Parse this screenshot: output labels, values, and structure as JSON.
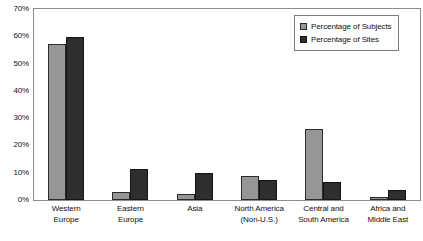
{
  "chart_data": {
    "type": "bar",
    "title": "",
    "xlabel": "",
    "ylabel": "",
    "ylim": [
      0,
      70
    ],
    "grid": false,
    "legend_position": "top-right",
    "ytick_labels": [
      "70%",
      "60%",
      "50%",
      "40%",
      "30%",
      "20%",
      "10%",
      "0%"
    ],
    "ytick_values": [
      70,
      60,
      50,
      40,
      30,
      20,
      10,
      0
    ],
    "categories": [
      "Western Europe",
      "Eastern Europe",
      "Asia",
      "North America (Non-U.S.)",
      "Central and South America",
      "Africa and Middle East"
    ],
    "category_lines": [
      [
        "Western",
        "Europe"
      ],
      [
        "Eastern",
        "Europe"
      ],
      [
        "Asia",
        ""
      ],
      [
        "North America",
        "(Non-U.S.)"
      ],
      [
        "Central and",
        "South America"
      ],
      [
        "Africa and",
        "Middle East"
      ]
    ],
    "series": [
      {
        "name": "Percentage of Subjects",
        "color": "#969696",
        "values": [
          57,
          3,
          2.3,
          8.7,
          26,
          1
        ]
      },
      {
        "name": "Percentage of Sites",
        "color": "#2e2e2e",
        "values": [
          59.7,
          11.4,
          10,
          7.2,
          6.5,
          3.5
        ]
      }
    ]
  },
  "legend": {
    "items": [
      {
        "label": "Percentage of Subjects",
        "swatch": "subjects"
      },
      {
        "label": "Percentage of Sites",
        "swatch": "sites"
      }
    ]
  },
  "colors": {
    "subjects": "#969696",
    "sites": "#2e2e2e",
    "frame": "#8d8d8d",
    "background": "#ffffff"
  }
}
